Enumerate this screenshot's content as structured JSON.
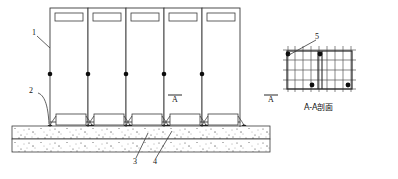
{
  "drawing": {
    "type": "structural-elevation-and-section",
    "title_section": "A-A剖面",
    "callouts": [
      {
        "id": "1",
        "label": "1"
      },
      {
        "id": "2",
        "label": "2"
      },
      {
        "id": "3",
        "label": "3"
      },
      {
        "id": "4",
        "label": "4"
      },
      {
        "id": "5",
        "label": "5"
      }
    ],
    "section_markers": [
      {
        "id": "A-left",
        "label": "A"
      },
      {
        "id": "A-right",
        "label": "A"
      }
    ],
    "elevation": {
      "panel_count": 5,
      "panel_window_count": 5,
      "node_dot_count": 5,
      "base_box_count": 5,
      "foundation_bands": 2
    },
    "section": {
      "mesh_columns": 8,
      "mesh_rows": 4,
      "corner_node_count": 4
    },
    "colors": {
      "ink": "#111111",
      "line": "#333333",
      "hatch": "#555555",
      "paper": "#ffffff"
    }
  }
}
